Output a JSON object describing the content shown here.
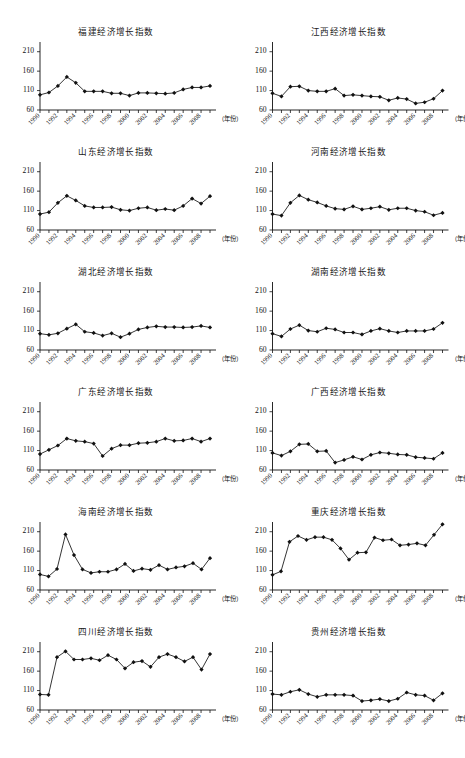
{
  "figure": {
    "background": "#ffffff",
    "marker_color": "#111111",
    "line_color": "#111111",
    "columns": 2,
    "rows": 6,
    "x_axis_caption": "（年份）",
    "y_ticks": [
      60,
      110,
      160,
      210
    ],
    "x_tick_years": [
      1990,
      1991,
      1992,
      1993,
      1994,
      1995,
      1996,
      1997,
      1998,
      1999,
      2000,
      2001,
      2002,
      2003,
      2004,
      2005,
      2006,
      2007,
      2008,
      2009
    ],
    "x_labeled_years": [
      1990,
      1992,
      1994,
      1996,
      1998,
      2000,
      2002,
      2004,
      2006,
      2008
    ]
  },
  "chart_data": [
    {
      "type": "line",
      "title": "福建经济增长指数",
      "xlabel": "（年份）",
      "ylabel": "",
      "ylim": [
        60,
        235
      ],
      "xlim": [
        1990,
        2009
      ],
      "grid": false,
      "legend": null,
      "x": [
        1990,
        1991,
        1992,
        1993,
        1994,
        1995,
        1996,
        1997,
        1998,
        1999,
        2000,
        2001,
        2002,
        2003,
        2004,
        2005,
        2006,
        2007,
        2008,
        2009
      ],
      "values": [
        99,
        105,
        122,
        145,
        130,
        108,
        108,
        108,
        103,
        103,
        97,
        104,
        104,
        103,
        102,
        104,
        113,
        118,
        118,
        122
      ]
    },
    {
      "type": "line",
      "title": "江西经济增长指数",
      "xlabel": "（年份）",
      "ylabel": "",
      "ylim": [
        60,
        235
      ],
      "xlim": [
        1990,
        2009
      ],
      "grid": false,
      "legend": null,
      "x": [
        1990,
        1991,
        1992,
        1993,
        1994,
        1995,
        1996,
        1997,
        1998,
        1999,
        2000,
        2001,
        2002,
        2003,
        2004,
        2005,
        2006,
        2007,
        2008,
        2009
      ],
      "values": [
        103,
        95,
        120,
        121,
        110,
        108,
        108,
        115,
        97,
        99,
        97,
        95,
        94,
        85,
        91,
        88,
        77,
        80,
        89,
        110
      ]
    },
    {
      "type": "line",
      "title": "山东经济增长指数",
      "xlabel": "（年份）",
      "ylabel": "",
      "ylim": [
        60,
        235
      ],
      "xlim": [
        1990,
        2009
      ],
      "grid": false,
      "legend": null,
      "x": [
        1990,
        1991,
        1992,
        1993,
        1994,
        1995,
        1996,
        1997,
        1998,
        1999,
        2000,
        2001,
        2002,
        2003,
        2004,
        2005,
        2006,
        2007,
        2008,
        2009
      ],
      "values": [
        101,
        106,
        130,
        148,
        136,
        122,
        118,
        118,
        119,
        112,
        110,
        116,
        118,
        111,
        114,
        111,
        122,
        141,
        128,
        147
      ]
    },
    {
      "type": "line",
      "title": "河南经济增长指数",
      "xlabel": "（年份）",
      "ylabel": "",
      "ylim": [
        60,
        235
      ],
      "xlim": [
        1990,
        2009
      ],
      "grid": false,
      "legend": null,
      "x": [
        1990,
        1991,
        1992,
        1993,
        1994,
        1995,
        1996,
        1997,
        1998,
        1999,
        2000,
        2001,
        2002,
        2003,
        2004,
        2005,
        2006,
        2007,
        2008,
        2009
      ],
      "values": [
        101,
        97,
        130,
        149,
        138,
        131,
        122,
        115,
        113,
        121,
        113,
        116,
        120,
        112,
        116,
        116,
        110,
        107,
        98,
        104
      ]
    },
    {
      "type": "line",
      "title": "湖北经济增长指数",
      "xlabel": "（年份）",
      "ylabel": "",
      "ylim": [
        60,
        235
      ],
      "xlim": [
        1990,
        2009
      ],
      "grid": false,
      "legend": null,
      "x": [
        1990,
        1991,
        1992,
        1993,
        1994,
        1995,
        1996,
        1997,
        1998,
        1999,
        2000,
        2001,
        2002,
        2003,
        2004,
        2005,
        2006,
        2007,
        2008,
        2009
      ],
      "values": [
        102,
        99,
        103,
        115,
        126,
        107,
        104,
        97,
        103,
        93,
        102,
        113,
        118,
        121,
        119,
        119,
        118,
        119,
        122,
        118
      ]
    },
    {
      "type": "line",
      "title": "湖南经济增长指数",
      "xlabel": "（年份）",
      "ylabel": "",
      "ylim": [
        60,
        235
      ],
      "xlim": [
        1990,
        2009
      ],
      "grid": false,
      "legend": null,
      "x": [
        1990,
        1991,
        1992,
        1993,
        1994,
        1995,
        1996,
        1997,
        1998,
        1999,
        2000,
        2001,
        2002,
        2003,
        2004,
        2005,
        2006,
        2007,
        2008,
        2009
      ],
      "values": [
        102,
        95,
        114,
        124,
        110,
        107,
        116,
        113,
        105,
        105,
        100,
        109,
        115,
        109,
        105,
        109,
        109,
        109,
        114,
        130
      ]
    },
    {
      "type": "line",
      "title": "广东经济增长指数",
      "xlabel": "（年份）",
      "ylabel": "",
      "ylim": [
        60,
        235
      ],
      "xlim": [
        1990,
        2009
      ],
      "grid": false,
      "legend": null,
      "x": [
        1990,
        1991,
        1992,
        1993,
        1994,
        1995,
        1996,
        1997,
        1998,
        1999,
        2000,
        2001,
        2002,
        2003,
        2004,
        2005,
        2006,
        2007,
        2008,
        2009
      ],
      "values": [
        101,
        112,
        123,
        141,
        135,
        133,
        128,
        96,
        115,
        124,
        124,
        129,
        130,
        133,
        141,
        135,
        136,
        141,
        133,
        141
      ]
    },
    {
      "type": "line",
      "title": "广西经济增长指数",
      "xlabel": "（年份）",
      "ylabel": "",
      "ylim": [
        60,
        235
      ],
      "xlim": [
        1990,
        2009
      ],
      "grid": false,
      "legend": null,
      "x": [
        1990,
        1991,
        1992,
        1993,
        1994,
        1995,
        1996,
        1997,
        1998,
        1999,
        2000,
        2001,
        2002,
        2003,
        2004,
        2005,
        2006,
        2007,
        2008,
        2009
      ],
      "values": [
        104,
        97,
        108,
        126,
        127,
        108,
        109,
        79,
        86,
        94,
        87,
        99,
        105,
        103,
        100,
        99,
        93,
        91,
        89,
        104
      ]
    },
    {
      "type": "line",
      "title": "海南经济增长指数",
      "xlabel": "（年份）",
      "ylabel": "",
      "ylim": [
        60,
        235
      ],
      "xlim": [
        1990,
        2009
      ],
      "grid": false,
      "legend": null,
      "x": [
        1990,
        1991,
        1992,
        1993,
        1994,
        1995,
        1996,
        1997,
        1998,
        1999,
        2000,
        2001,
        2002,
        2003,
        2004,
        2005,
        2006,
        2007,
        2008,
        2009
      ],
      "values": [
        100,
        95,
        114,
        203,
        150,
        113,
        104,
        107,
        107,
        113,
        127,
        109,
        115,
        112,
        124,
        113,
        118,
        121,
        129,
        113,
        142
      ]
    },
    {
      "type": "line",
      "title": "重庆经济增长指数",
      "xlabel": "（年份）",
      "ylabel": "",
      "ylim": [
        60,
        235
      ],
      "xlim": [
        1990,
        2009
      ],
      "grid": false,
      "legend": null,
      "x": [
        1990,
        1991,
        1992,
        1993,
        1994,
        1995,
        1996,
        1997,
        1998,
        1999,
        2000,
        2001,
        2002,
        2003,
        2004,
        2005,
        2006,
        2007,
        2008,
        2009
      ],
      "values": [
        99,
        108,
        184,
        199,
        189,
        196,
        196,
        189,
        167,
        138,
        156,
        157,
        195,
        188,
        190,
        175,
        177,
        180,
        175,
        202,
        229
      ]
    },
    {
      "type": "line",
      "title": "四川经济增长指数",
      "xlabel": "（年份）",
      "ylabel": "",
      "ylim": [
        60,
        235
      ],
      "xlim": [
        1990,
        2009
      ],
      "grid": false,
      "legend": null,
      "x": [
        1990,
        1991,
        1992,
        1993,
        1994,
        1995,
        1996,
        1997,
        1998,
        1999,
        2000,
        2001,
        2002,
        2003,
        2004,
        2005,
        2006,
        2007,
        2008,
        2009
      ],
      "values": [
        100,
        99,
        196,
        211,
        190,
        190,
        193,
        188,
        201,
        190,
        167,
        183,
        186,
        171,
        196,
        204,
        196,
        185,
        196,
        164,
        204
      ]
    },
    {
      "type": "line",
      "title": "贵州经济增长指数",
      "xlabel": "（年份）",
      "ylabel": "",
      "ylim": [
        60,
        235
      ],
      "xlim": [
        1990,
        2009
      ],
      "grid": false,
      "legend": null,
      "x": [
        1990,
        1991,
        1992,
        1993,
        1994,
        1995,
        1996,
        1997,
        1998,
        1999,
        2000,
        2001,
        2002,
        2003,
        2004,
        2005,
        2006,
        2007,
        2008,
        2009
      ],
      "values": [
        101,
        99,
        107,
        112,
        101,
        94,
        99,
        99,
        99,
        97,
        83,
        85,
        88,
        83,
        89,
        105,
        99,
        97,
        85,
        103
      ]
    }
  ]
}
